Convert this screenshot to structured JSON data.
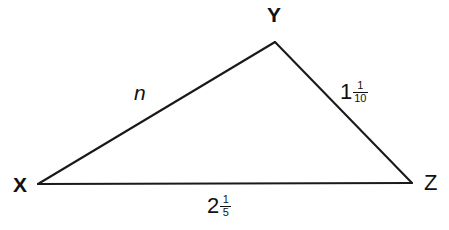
{
  "figure": {
    "type": "triangle-diagram",
    "background_color": "#ffffff",
    "stroke_color": "#1a1a1a",
    "text_color": "#111111"
  },
  "vertices": [
    {
      "label": "X",
      "x": 38,
      "y": 184,
      "label_x": 13,
      "label_y": 174,
      "bold": true
    },
    {
      "label": "Y",
      "x": 275,
      "y": 42,
      "label_x": 267,
      "label_y": 4,
      "bold": true
    },
    {
      "label": "Z",
      "x": 412,
      "y": 183,
      "label_x": 424,
      "label_y": 172,
      "bold": false
    }
  ],
  "sides": [
    {
      "name": "side-xy",
      "from": "X",
      "to": "Y",
      "label_kind": "variable",
      "label": "n",
      "label_x": 134,
      "label_y": 82
    },
    {
      "name": "side-yz",
      "from": "Y",
      "to": "Z",
      "label_kind": "mixed-number",
      "whole": "1",
      "numerator": "1",
      "denominator": "10",
      "label_text": "1 1/10",
      "label_x": 340,
      "label_y": 80
    },
    {
      "name": "side-xz",
      "from": "X",
      "to": "Z",
      "label_kind": "mixed-number",
      "whole": "2",
      "numerator": "1",
      "denominator": "5",
      "label_text": "2 1/5",
      "label_x": 207,
      "label_y": 194
    }
  ]
}
